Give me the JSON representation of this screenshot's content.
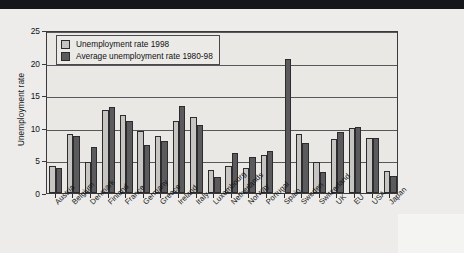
{
  "chart_data": {
    "type": "bar",
    "title": "",
    "xlabel": "",
    "ylabel": "Unemployment rate",
    "ylim": [
      0,
      25
    ],
    "yticks": [
      0,
      5,
      10,
      15,
      20,
      25
    ],
    "grid": true,
    "legend_position": "top-left",
    "categories": [
      "Austria",
      "Belgium",
      "Denmark",
      "Finland",
      "France",
      "Germany",
      "Greece",
      "Ireland",
      "Italy",
      "Luxembourg",
      "Netherlands",
      "Norway",
      "Portugal",
      "Spain",
      "Sweden",
      "Switzerland",
      "UK",
      "EU",
      "USA",
      "Japan"
    ],
    "series": [
      {
        "name": "Unemployment rate 1998",
        "color": "#c6c5c1",
        "values": [
          4.2,
          9.1,
          4.8,
          12.8,
          11.9,
          9.5,
          8.8,
          11.0,
          11.7,
          3.5,
          4.2,
          3.8,
          5.8,
          0.0,
          9.1,
          4.8,
          8.3,
          10.0,
          8.5,
          3.3
        ]
      },
      {
        "name": "Average unemployment rate 1980-98",
        "color": "#5b5b5d",
        "values": [
          3.9,
          8.8,
          7.0,
          13.2,
          11.1,
          7.4,
          8.0,
          13.4,
          10.5,
          2.4,
          6.1,
          5.5,
          6.4,
          20.5,
          7.7,
          3.2,
          9.3,
          10.1,
          8.4,
          2.6
        ]
      }
    ]
  },
  "legend": {
    "items": [
      {
        "label": "Unemployment rate 1998",
        "swatch": "light"
      },
      {
        "label": "Average unemployment rate 1980-98",
        "swatch": "dark"
      }
    ]
  },
  "axis": {
    "y_label": "Unemployment rate",
    "y_ticks": [
      "0",
      "5",
      "10",
      "15",
      "20",
      "25"
    ]
  },
  "colors": {
    "light_bar": "#c6c5c1",
    "dark_bar": "#5b5b5d",
    "plot_background": "#e9e8e5",
    "page_background": "#eeeeec",
    "axis_line": "#3a3a3c",
    "gridline": "#58585a",
    "text": "#121214"
  }
}
